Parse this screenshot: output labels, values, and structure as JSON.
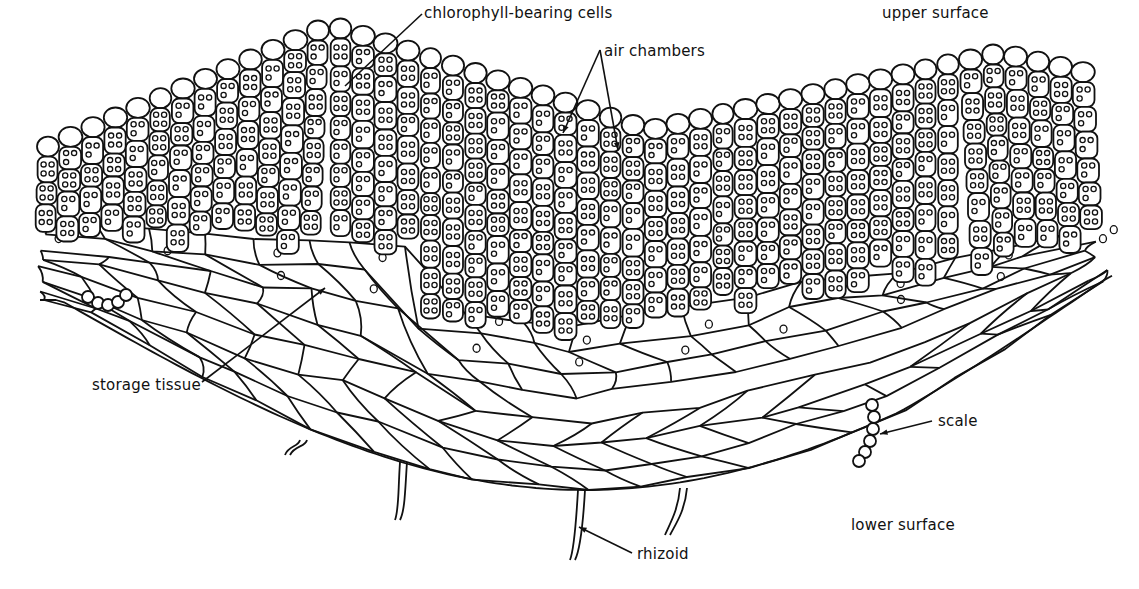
{
  "diagram": {
    "colors": {
      "ink": "#111111",
      "background": "#ffffff"
    },
    "labels": [
      {
        "id": "chlorophyll",
        "text": "chlorophyll-bearing cells",
        "x": 424,
        "y": 4
      },
      {
        "id": "air-chambers",
        "text": "air chambers",
        "x": 604,
        "y": 42
      },
      {
        "id": "upper-surface",
        "text": "upper surface",
        "x": 882,
        "y": 4
      },
      {
        "id": "storage-tissue",
        "text": "storage tissue",
        "x": 92,
        "y": 376
      },
      {
        "id": "scale",
        "text": "scale",
        "x": 938,
        "y": 412
      },
      {
        "id": "lower-surface",
        "text": "lower surface",
        "x": 851,
        "y": 516
      },
      {
        "id": "rhizoid",
        "text": "rhizoid",
        "x": 637,
        "y": 545
      }
    ],
    "structures": [
      "chlorophyll-bearing cell filaments",
      "air chambers",
      "storage tissue",
      "scales",
      "rhizoids"
    ]
  }
}
